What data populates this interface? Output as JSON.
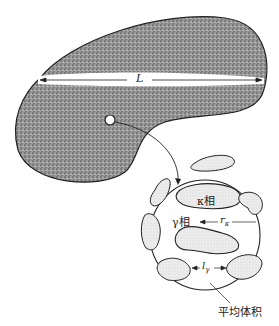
{
  "diagram": {
    "macro_region": {
      "length_label": "L"
    },
    "magnified_region": {
      "kappa_phase_label": "κ相",
      "gamma_phase_label": "γ相",
      "r_label": "r",
      "r_subscript": "κ",
      "l_label": "l",
      "l_subscript": "γ",
      "average_volume_label": "平均体积"
    },
    "colors": {
      "stipple": "#7a7a7a",
      "outline": "#222222",
      "light_fill": "#e6e6e6"
    }
  }
}
